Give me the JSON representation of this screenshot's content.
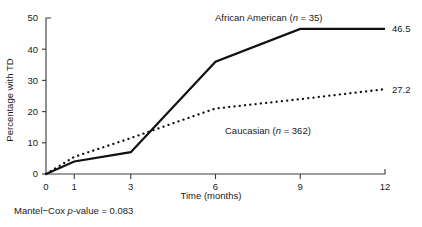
{
  "chart_data": {
    "type": "line",
    "title": "",
    "xlabel": "Time (months)",
    "ylabel": "Percentage with TD",
    "x_ticks": [
      0,
      1,
      3,
      6,
      9,
      12
    ],
    "x_tick_labels": [
      "0",
      "1",
      "3",
      "6",
      "9",
      "12"
    ],
    "y_ticks": [
      0,
      10,
      20,
      30,
      40,
      50
    ],
    "y_tick_labels": [
      "0",
      "10",
      "20",
      "30",
      "40",
      "50"
    ],
    "xlim": [
      0,
      12
    ],
    "ylim": [
      0,
      50
    ],
    "grid": false,
    "legend_position": "inline-annotations",
    "series": [
      {
        "name": "African American",
        "n": 35,
        "label": "African American (n = 35)",
        "label_prefix": "African American (",
        "label_italic": "n",
        "label_suffix": " = 35)",
        "style": "solid",
        "color": "#111111",
        "x": [
          0,
          1,
          3,
          6,
          9,
          12
        ],
        "values": [
          0,
          4.0,
          7.0,
          36.0,
          46.5,
          46.5
        ],
        "end_label": "46.5"
      },
      {
        "name": "Caucasian",
        "n": 362,
        "label": "Caucasian (n = 362)",
        "label_prefix": "Caucasian (",
        "label_italic": "n",
        "label_suffix": " = 362)",
        "style": "dotted",
        "color": "#111111",
        "x": [
          0,
          1,
          3,
          6,
          9,
          12
        ],
        "values": [
          0,
          5.5,
          11.5,
          21.0,
          24.0,
          27.2
        ],
        "end_label": "27.2"
      }
    ]
  },
  "footnote": {
    "prefix": "Mantel−Cox  ",
    "italic": "p",
    "suffix": "-value = 0.083",
    "full_text": "Mantel−Cox  p-value = 0.083"
  },
  "colors": {
    "axis": "#3a3a3a",
    "line": "#111111",
    "background": "#ffffff",
    "text": "#1a1a1a"
  }
}
